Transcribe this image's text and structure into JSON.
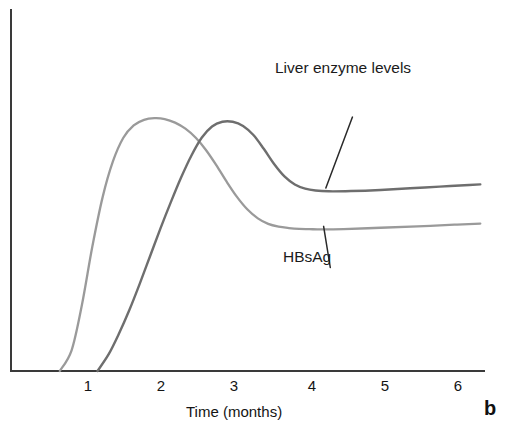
{
  "figure": {
    "panel_letter": "b",
    "background_color": "#ffffff"
  },
  "axes": {
    "x_axis_title": "Time (months)",
    "x_tick_labels": [
      "1",
      "2",
      "3",
      "4",
      "5",
      "6"
    ],
    "y_axis_title": "",
    "y_tick_labels": [],
    "axis_color": "#3a3a3a"
  },
  "annotations": {
    "liver_enzyme_label": "Liver enzyme levels",
    "hbsag_label": "HBsAg",
    "leader_line_color": "#2a2a2a"
  },
  "chart_data": {
    "type": "line",
    "title": "",
    "subtitle": "",
    "xlabel": "Time (months)",
    "ylabel": "",
    "xlim": [
      0,
      6.4
    ],
    "ylim": [
      0,
      100
    ],
    "grid": false,
    "legend": "inline-annotations",
    "x_ticks": [
      1,
      2,
      3,
      4,
      5,
      6
    ],
    "annotations": [
      {
        "text": "Liver enzyme levels",
        "series": "Liver enzyme levels",
        "leader_from": [
          4.62,
          92.0
        ],
        "leader_to": [
          4.26,
          66.3
        ]
      },
      {
        "text": "HBsAg",
        "series": "HBsAg",
        "leader_from": [
          4.32,
          37.5
        ],
        "leader_to": [
          4.23,
          52.4
        ]
      }
    ],
    "series": [
      {
        "name": "HBsAg",
        "color": "#9a9a9a",
        "width": 2.3,
        "x": [
          0.66,
          0.82,
          0.96,
          1.1,
          1.24,
          1.38,
          1.52,
          1.66,
          1.8,
          1.94,
          2.08,
          2.22,
          2.36,
          2.5,
          2.64,
          2.78,
          2.92,
          3.06,
          3.2,
          3.34,
          3.48,
          3.62,
          3.76,
          3.9,
          4.04,
          4.2,
          4.5,
          5.0,
          5.5,
          6.0,
          6.35
        ],
        "y": [
          0.0,
          7.5,
          24.0,
          45.0,
          63.0,
          76.0,
          84.5,
          89.0,
          91.0,
          91.6,
          91.3,
          90.0,
          87.8,
          84.5,
          80.0,
          74.5,
          68.5,
          63.0,
          58.5,
          55.3,
          53.3,
          52.3,
          51.8,
          51.5,
          51.4,
          51.3,
          51.4,
          51.9,
          52.4,
          53.0,
          53.4
        ]
      },
      {
        "name": "Liver enzyme levels",
        "color": "#6e6e6e",
        "width": 2.4,
        "x": [
          1.17,
          1.32,
          1.46,
          1.6,
          1.74,
          1.88,
          2.02,
          2.16,
          2.3,
          2.44,
          2.58,
          2.72,
          2.86,
          3.0,
          3.14,
          3.28,
          3.42,
          3.56,
          3.7,
          3.84,
          3.98,
          4.12,
          4.3,
          4.6,
          5.0,
          5.4,
          5.8,
          6.2,
          6.35
        ],
        "y": [
          0.0,
          6.0,
          13.5,
          22.0,
          31.5,
          41.5,
          51.5,
          61.0,
          70.0,
          78.0,
          84.5,
          88.6,
          90.3,
          90.3,
          88.8,
          85.5,
          80.5,
          75.0,
          70.5,
          67.6,
          66.1,
          65.4,
          65.1,
          65.2,
          65.6,
          66.2,
          66.8,
          67.4,
          67.6
        ]
      }
    ]
  }
}
